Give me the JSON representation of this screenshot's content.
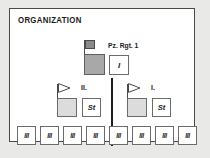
{
  "page": {
    "title": "ORGANIZATION",
    "background_color": "#e9e9e7",
    "panel_color": "#ffffff",
    "border_color": "#4a4a4a",
    "text_color": "#1a1a1a"
  },
  "regiment": {
    "label": "Pz. Rgt. 1",
    "flag_icon": "regiment-flag-icon",
    "unit_square_color": "#a8a8a8",
    "flag_color": "#8a8a8a",
    "staff": {
      "label": "I",
      "box_color": "#ffffff"
    }
  },
  "battalions": [
    {
      "id": "battalion-ii",
      "label": "II.",
      "pennant_icon": "battalion-pennant-icon",
      "unit_square_color": "#dcdcdc",
      "staff": {
        "label": "St"
      }
    },
    {
      "id": "battalion-i",
      "label": "I.",
      "pennant_icon": "battalion-pennant-icon",
      "unit_square_color": "#dcdcdc",
      "staff": {
        "label": "St"
      }
    }
  ],
  "divider": {
    "name": "center-divider",
    "color": "#1f1f1f"
  },
  "companies": [
    {
      "id": "company-1",
      "label": "III",
      "group": "battalion-ii"
    },
    {
      "id": "company-2",
      "label": "III",
      "group": "battalion-ii"
    },
    {
      "id": "company-3",
      "label": "III",
      "group": "battalion-ii"
    },
    {
      "id": "company-4",
      "label": "III",
      "group": "battalion-ii"
    },
    {
      "id": "company-5",
      "label": "III",
      "group": "battalion-i"
    },
    {
      "id": "company-6",
      "label": "III",
      "group": "battalion-i"
    },
    {
      "id": "company-7",
      "label": "III",
      "group": "battalion-i"
    },
    {
      "id": "company-8",
      "label": "III",
      "group": "battalion-i"
    }
  ],
  "company_positions": [
    16,
    39,
    62,
    85,
    108,
    131,
    154,
    177
  ]
}
